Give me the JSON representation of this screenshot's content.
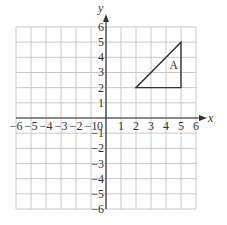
{
  "figure": {
    "axis_labels": {
      "x": "x",
      "y": "y"
    },
    "x_range": [
      -6,
      6
    ],
    "y_range": [
      -6,
      6
    ],
    "x_tick_labels": [
      "−6",
      "−5",
      "−4",
      "−3",
      "−2",
      "−1",
      "0",
      "1",
      "2",
      "3",
      "4",
      "5",
      "6"
    ],
    "y_tick_labels": [
      "6",
      "5",
      "4",
      "3",
      "2",
      "1",
      "−1",
      "−2",
      "−3",
      "−4",
      "−5",
      "−6"
    ],
    "origin_label": "0",
    "shape": {
      "name": "A",
      "type": "right triangle",
      "vertices": [
        [
          2,
          2
        ],
        [
          5,
          2
        ],
        [
          5,
          5
        ]
      ],
      "label_position": [
        4.5,
        3.5
      ]
    },
    "colors": {
      "grid": "#c8c8c8",
      "axis": "#333333",
      "shape": "#333333",
      "text": "#333333"
    }
  }
}
